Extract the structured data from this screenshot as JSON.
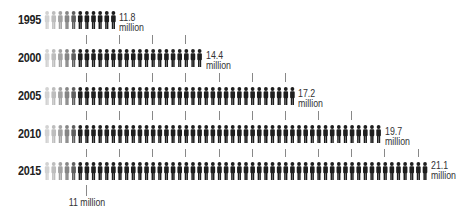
{
  "chart_data": {
    "type": "bar",
    "style": "pictograph",
    "title": "",
    "categories": [
      "1995",
      "2000",
      "2005",
      "2010",
      "2015"
    ],
    "values": [
      11.8,
      14.4,
      17.2,
      19.7,
      21.1
    ],
    "value_labels": [
      "11.8 million",
      "14.4 million",
      "17.2 million",
      "19.7 million",
      "21.1 million"
    ],
    "unit": "million",
    "figures_per_row": [
      11,
      24,
      38,
      51,
      58
    ],
    "tick_interval": 1,
    "baseline_annotation": "11 million",
    "xlabel": "",
    "ylabel": "",
    "grid": false,
    "legend": null
  },
  "rows": [
    {
      "year": "1995",
      "value": "11.8",
      "unit": "million",
      "count": 11,
      "ticks_below": 4
    },
    {
      "year": "2000",
      "value": "14.4",
      "unit": "million",
      "count": 24,
      "ticks_below": 7
    },
    {
      "year": "2005",
      "value": "17.2",
      "unit": "million",
      "count": 38,
      "ticks_below": 9
    },
    {
      "year": "2010",
      "value": "19.7",
      "unit": "million",
      "count": 51,
      "ticks_below": 11
    },
    {
      "year": "2015",
      "value": "21.1",
      "unit": "million",
      "count": 58,
      "ticks_below": 1
    }
  ],
  "annotation": {
    "label": "11 million"
  },
  "colors": {
    "figure": "#1e1e1e",
    "fade": [
      "#d2d2d2",
      "#bdbdbd",
      "#a2a2a2",
      "#858585",
      "#5e5e5e"
    ],
    "tick": "#888888"
  }
}
